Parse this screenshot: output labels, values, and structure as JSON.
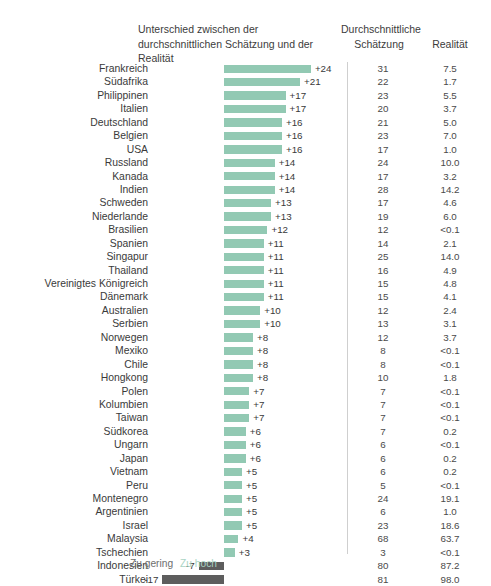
{
  "header": {
    "diff_title": "Unterschied zwischen der durchschnittlichen Schätzung und der Realität",
    "estimate_title_line1": "Durchschnittliche",
    "estimate_title_line2": "Schätzung",
    "reality_title": "Realität"
  },
  "legend": {
    "too_low": "Zu gering",
    "too_high": "Zu hoch",
    "too_low_color": "#6e6e6e",
    "too_high_color": "#a9d4c4"
  },
  "colors": {
    "bar_positive": "#92c9b3",
    "bar_negative": "#5d5d5d",
    "separator": "#cfcfcf",
    "text": "#3a3a3a"
  },
  "chart_data": {
    "type": "bar",
    "title": "Unterschied zwischen der durchschnittlichen Schätzung und der Realität",
    "xlabel": "",
    "ylabel": "",
    "orientation": "horizontal",
    "grid": false,
    "legend_position": "bottom",
    "columns": [
      "Land",
      "Unterschied",
      "Durchschnittliche Schätzung",
      "Realität"
    ],
    "categories": [
      "Frankreich",
      "Südafrika",
      "Philippinen",
      "Italien",
      "Deutschland",
      "Belgien",
      "USA",
      "Russland",
      "Kanada",
      "Indien",
      "Schweden",
      "Niederlande",
      "Brasilien",
      "Spanien",
      "Singapur",
      "Thailand",
      "Vereinigtes Königreich",
      "Dänemark",
      "Australien",
      "Serbien",
      "Norwegen",
      "Mexiko",
      "Chile",
      "Hongkong",
      "Polen",
      "Kolumbien",
      "Taiwan",
      "Südkorea",
      "Ungarn",
      "Japan",
      "Vietnam",
      "Peru",
      "Montenegro",
      "Argentinien",
      "Israel",
      "Malaysia",
      "Tschechien",
      "Indonesien",
      "Türkei"
    ],
    "values": [
      24,
      21,
      17,
      17,
      16,
      16,
      16,
      14,
      14,
      14,
      13,
      13,
      12,
      11,
      11,
      11,
      11,
      11,
      10,
      10,
      8,
      8,
      8,
      8,
      7,
      7,
      7,
      6,
      6,
      6,
      5,
      5,
      5,
      5,
      5,
      4,
      3,
      -7,
      -17
    ],
    "xlim": [
      -18,
      26
    ],
    "rows": [
      {
        "country": "Frankreich",
        "diff": 24,
        "diff_label": "+24",
        "estimate": "31",
        "reality": "7.5"
      },
      {
        "country": "Südafrika",
        "diff": 21,
        "diff_label": "+21",
        "estimate": "22",
        "reality": "1.7"
      },
      {
        "country": "Philippinen",
        "diff": 17,
        "diff_label": "+17",
        "estimate": "23",
        "reality": "5.5"
      },
      {
        "country": "Italien",
        "diff": 17,
        "diff_label": "+17",
        "estimate": "20",
        "reality": "3.7"
      },
      {
        "country": "Deutschland",
        "diff": 16,
        "diff_label": "+16",
        "estimate": "21",
        "reality": "5.0"
      },
      {
        "country": "Belgien",
        "diff": 16,
        "diff_label": "+16",
        "estimate": "23",
        "reality": "7.0"
      },
      {
        "country": "USA",
        "diff": 16,
        "diff_label": "+16",
        "estimate": "17",
        "reality": "1.0"
      },
      {
        "country": "Russland",
        "diff": 14,
        "diff_label": "+14",
        "estimate": "24",
        "reality": "10.0"
      },
      {
        "country": "Kanada",
        "diff": 14,
        "diff_label": "+14",
        "estimate": "17",
        "reality": "3.2"
      },
      {
        "country": "Indien",
        "diff": 14,
        "diff_label": "+14",
        "estimate": "28",
        "reality": "14.2"
      },
      {
        "country": "Schweden",
        "diff": 13,
        "diff_label": "+13",
        "estimate": "17",
        "reality": "4.6"
      },
      {
        "country": "Niederlande",
        "diff": 13,
        "diff_label": "+13",
        "estimate": "19",
        "reality": "6.0"
      },
      {
        "country": "Brasilien",
        "diff": 12,
        "diff_label": "+12",
        "estimate": "12",
        "reality": "<0.1"
      },
      {
        "country": "Spanien",
        "diff": 11,
        "diff_label": "+11",
        "estimate": "14",
        "reality": "2.1"
      },
      {
        "country": "Singapur",
        "diff": 11,
        "diff_label": "+11",
        "estimate": "25",
        "reality": "14.0"
      },
      {
        "country": "Thailand",
        "diff": 11,
        "diff_label": "+11",
        "estimate": "16",
        "reality": "4.9"
      },
      {
        "country": "Vereinigtes Königreich",
        "diff": 11,
        "diff_label": "+11",
        "estimate": "15",
        "reality": "4.8"
      },
      {
        "country": "Dänemark",
        "diff": 11,
        "diff_label": "+11",
        "estimate": "15",
        "reality": "4.1"
      },
      {
        "country": "Australien",
        "diff": 10,
        "diff_label": "+10",
        "estimate": "12",
        "reality": "2.4"
      },
      {
        "country": "Serbien",
        "diff": 10,
        "diff_label": "+10",
        "estimate": "13",
        "reality": "3.1"
      },
      {
        "country": "Norwegen",
        "diff": 8,
        "diff_label": "+8",
        "estimate": "12",
        "reality": "3.7"
      },
      {
        "country": "Mexiko",
        "diff": 8,
        "diff_label": "+8",
        "estimate": "8",
        "reality": "<0.1"
      },
      {
        "country": "Chile",
        "diff": 8,
        "diff_label": "+8",
        "estimate": "8",
        "reality": "<0.1"
      },
      {
        "country": "Hongkong",
        "diff": 8,
        "diff_label": "+8",
        "estimate": "10",
        "reality": "1.8"
      },
      {
        "country": "Polen",
        "diff": 7,
        "diff_label": "+7",
        "estimate": "7",
        "reality": "<0.1"
      },
      {
        "country": "Kolumbien",
        "diff": 7,
        "diff_label": "+7",
        "estimate": "7",
        "reality": "<0.1"
      },
      {
        "country": "Taiwan",
        "diff": 7,
        "diff_label": "+7",
        "estimate": "7",
        "reality": "<0.1"
      },
      {
        "country": "Südkorea",
        "diff": 6,
        "diff_label": "+6",
        "estimate": "7",
        "reality": "0.2"
      },
      {
        "country": "Ungarn",
        "diff": 6,
        "diff_label": "+6",
        "estimate": "6",
        "reality": "<0.1"
      },
      {
        "country": "Japan",
        "diff": 6,
        "diff_label": "+6",
        "estimate": "6",
        "reality": "0.2"
      },
      {
        "country": "Vietnam",
        "diff": 5,
        "diff_label": "+5",
        "estimate": "6",
        "reality": "0.2"
      },
      {
        "country": "Peru",
        "diff": 5,
        "diff_label": "+5",
        "estimate": "5",
        "reality": "<0.1"
      },
      {
        "country": "Montenegro",
        "diff": 5,
        "diff_label": "+5",
        "estimate": "24",
        "reality": "19.1"
      },
      {
        "country": "Argentinien",
        "diff": 5,
        "diff_label": "+5",
        "estimate": "6",
        "reality": "1.0"
      },
      {
        "country": "Israel",
        "diff": 5,
        "diff_label": "+5",
        "estimate": "23",
        "reality": "18.6"
      },
      {
        "country": "Malaysia",
        "diff": 4,
        "diff_label": "+4",
        "estimate": "68",
        "reality": "63.7"
      },
      {
        "country": "Tschechien",
        "diff": 3,
        "diff_label": "+3",
        "estimate": "3",
        "reality": "<0.1"
      },
      {
        "country": "Indonesien",
        "diff": -7,
        "diff_label": "-7",
        "estimate": "80",
        "reality": "87.2"
      },
      {
        "country": "Türkei",
        "diff": -17,
        "diff_label": "-17",
        "estimate": "81",
        "reality": "98.0"
      }
    ]
  }
}
